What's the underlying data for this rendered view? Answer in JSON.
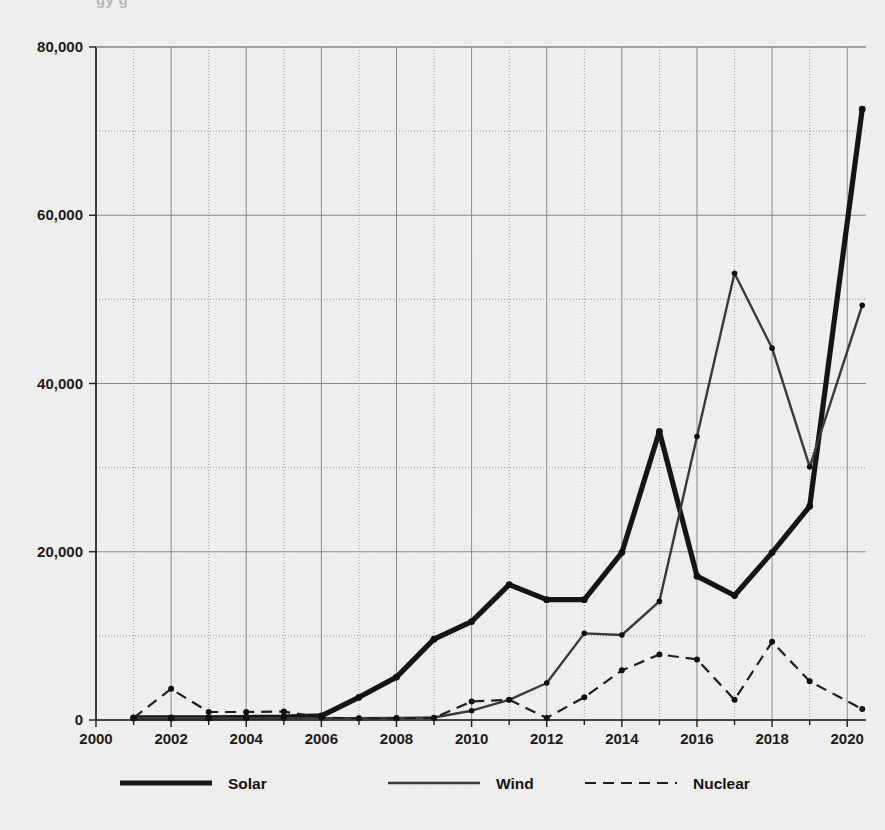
{
  "figure": {
    "background_color": "#f2f1ef",
    "ink_color": "#151515",
    "cut_off_caption_fragment": "gy   g"
  },
  "legend": {
    "position": "bottom-center",
    "items": [
      {
        "label": "Solar",
        "style": "thick-solid",
        "color": "#151515"
      },
      {
        "label": "Wind",
        "style": "thin-solid",
        "color": "#3a3a3a"
      },
      {
        "label": "Nuclear",
        "style": "dashed",
        "color": "#1f1f1f"
      }
    ]
  },
  "axes": {
    "x": {
      "label": "",
      "ticks": [
        2000,
        2002,
        2004,
        2006,
        2008,
        2010,
        2012,
        2014,
        2016,
        2018,
        2020
      ],
      "tick_labels": [
        "2000",
        "2002",
        "2004",
        "2006",
        "2008",
        "2010",
        "2012",
        "2014",
        "2016",
        "2018",
        "2020"
      ],
      "range": [
        2000,
        2020.5
      ],
      "minor_step": 1
    },
    "y": {
      "label": "",
      "ticks": [
        0,
        20000,
        40000,
        60000,
        80000
      ],
      "tick_labels": [
        "0",
        "20,000",
        "40,000",
        "60,000",
        "80,000"
      ],
      "range": [
        0,
        80000
      ],
      "minor_step": 10000,
      "grid": true
    }
  },
  "chart_data": {
    "type": "line",
    "title": "",
    "subtitle": "",
    "xlabel": "",
    "ylabel": "",
    "xlim": [
      2000,
      2020.5
    ],
    "ylim": [
      0,
      80000
    ],
    "grid": true,
    "legend_position": "bottom-center",
    "x": [
      2001,
      2002,
      2003,
      2004,
      2005,
      2006,
      2007,
      2008,
      2009,
      2010,
      2011,
      2012,
      2013,
      2014,
      2015,
      2016,
      2017,
      2018,
      2019,
      2020.4
    ],
    "series": [
      {
        "name": "Solar",
        "style": "thick-solid",
        "values": [
          250,
          250,
          250,
          300,
          350,
          500,
          2700,
          5100,
          9600,
          11700,
          16100,
          14300,
          14300,
          19900,
          34300,
          17100,
          14800,
          19900,
          25400,
          72600
        ]
      },
      {
        "name": "Wind",
        "style": "thin-solid",
        "values": [
          200,
          200,
          200,
          200,
          200,
          200,
          200,
          250,
          300,
          1100,
          2400,
          4400,
          10300,
          10100,
          14100,
          33700,
          53100,
          44200,
          30100,
          49300
        ]
      },
      {
        "name": "Nuclear",
        "style": "dashed",
        "values": [
          250,
          3700,
          950,
          950,
          1000,
          300,
          200,
          200,
          250,
          2200,
          2400,
          250,
          2700,
          5900,
          7800,
          7200,
          2400,
          9300,
          4600,
          1300
        ]
      }
    ]
  }
}
